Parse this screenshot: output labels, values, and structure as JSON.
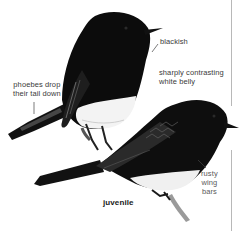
{
  "figure": {
    "birds": [
      {
        "id": "adult",
        "description": "adult perched, black with white belly"
      },
      {
        "id": "juvenile",
        "description": "juvenile perched on twig"
      }
    ],
    "annotations": {
      "blackish": "blackish",
      "belly_line1": "sharply contrasting",
      "belly_line2": "white belly",
      "tail_line1": "phoebes drop",
      "tail_line2": "their tail down",
      "rusty_line1": "rusty",
      "rusty_line2": "wing",
      "rusty_line3": "bars",
      "juvenile": "juvenile"
    },
    "colors": {
      "plumage": "#0d0d0d",
      "belly": "#f2f2f2",
      "label_text": "#3a3a3a",
      "rule": "#b8b8b8",
      "twig": "#9a9a9a"
    }
  }
}
